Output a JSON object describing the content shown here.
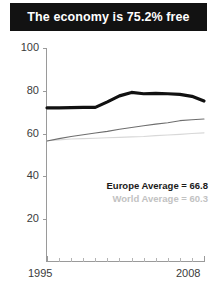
{
  "title": {
    "text": "The economy is 75.2% free"
  },
  "legend": {
    "europe": "Europe Average = 66.8",
    "world": "World Average = 60.3"
  },
  "axis": {
    "y_ticks": [
      "100",
      "80",
      "60",
      "40",
      "20"
    ],
    "x_start": "1995",
    "x_end": "2008"
  },
  "colors": {
    "title_bar": "#121212",
    "title_text": "#ffffff",
    "country_line": "#111111",
    "europe_line": "#6e6e6e",
    "world_line": "#d8d8d8",
    "axis": "#9a9a9a",
    "tick_text": "#3b3b3b"
  },
  "chart_data": {
    "type": "line",
    "title": "The economy is 75.2% free",
    "xlabel": "",
    "ylabel": "",
    "xlim": [
      1995,
      2008
    ],
    "ylim": [
      0,
      100
    ],
    "ytick_values": [
      20,
      40,
      60,
      80,
      100
    ],
    "grid": false,
    "legend_position": "inside-lower-right",
    "x": [
      1995,
      1996,
      1997,
      1998,
      1999,
      2000,
      2001,
      2002,
      2003,
      2004,
      2005,
      2006,
      2007,
      2008
    ],
    "series": [
      {
        "name": "Country",
        "color": "#111111",
        "linewidth": 3.2,
        "values": [
          72.0,
          72.0,
          72.1,
          72.2,
          72.2,
          74.8,
          77.6,
          79.2,
          78.6,
          78.8,
          78.6,
          78.3,
          77.4,
          75.2
        ]
      },
      {
        "name": "Europe Average",
        "color": "#6e6e6e",
        "linewidth": 1.1,
        "average": 66.8,
        "values": [
          56.5,
          57.6,
          58.6,
          59.4,
          60.2,
          61.0,
          62.0,
          62.8,
          63.6,
          64.4,
          65.0,
          66.0,
          66.4,
          66.8
        ]
      },
      {
        "name": "World Average",
        "color": "#d8d8d8",
        "linewidth": 1.1,
        "average": 60.3,
        "values": [
          56.6,
          57.0,
          57.4,
          57.6,
          57.8,
          58.0,
          58.2,
          58.4,
          58.6,
          59.0,
          59.3,
          59.6,
          60.0,
          60.3
        ]
      }
    ],
    "annotations": [
      "Europe Average = 66.8",
      "World Average = 60.3"
    ]
  }
}
